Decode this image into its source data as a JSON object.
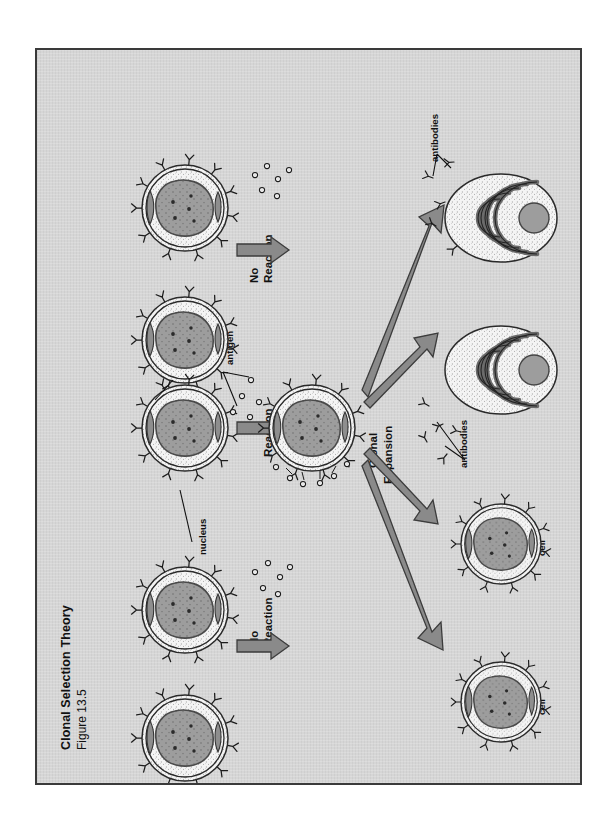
{
  "figure": {
    "title": "Clonal Selection Theory",
    "subtitle": "Figure 13.5",
    "background_color": "#d6d6d6",
    "border_color": "#3a3a3a",
    "arrow_color": "#8a8a8a",
    "nucleus_color": "#9a9a9a",
    "cytoplasm_color": "#f2f2f2"
  },
  "labels": {
    "antigen_receptor_line1": "antigen",
    "antigen_receptor_line2": "receptor",
    "nucleus": "nucleus",
    "antigen": "antigen",
    "no_reaction_line1": "No",
    "no_reaction_line2": "Reaction",
    "reaction": "Reaction",
    "clonal_expansion_line1": "Clonal",
    "clonal_expansion_line2": "Expansion",
    "antibodies": "antibodies",
    "plasma_cell_line1": "plasma",
    "plasma_cell_line2": "cell",
    "memory_cell_line1": "memory",
    "memory_cell_line2": "cell"
  },
  "rows": [
    {
      "id": "row-top",
      "outcome_line1": "No",
      "outcome_line2": "Reaction",
      "left_cell": "lymphocyte-resting",
      "right_cell": "lymphocyte-resting"
    },
    {
      "id": "row-middle",
      "outcome": "Reaction",
      "left_cell": "lymphocyte-resting",
      "right_cell": "lymphocyte-activated"
    },
    {
      "id": "row-bottom",
      "outcome_line1": "No",
      "outcome_line2": "Reaction",
      "left_cell": "lymphocyte-resting",
      "right_cell": "lymphocyte-resting"
    }
  ],
  "progeny": [
    {
      "id": "plasma-cell-1",
      "line1": "plasma",
      "line2": "cell"
    },
    {
      "id": "plasma-cell-2",
      "line1": "plasma",
      "line2": "cell"
    },
    {
      "id": "memory-cell-1",
      "line1": "memory",
      "line2": "cell"
    },
    {
      "id": "memory-cell-2",
      "line1": "memory",
      "line2": "cell"
    }
  ]
}
